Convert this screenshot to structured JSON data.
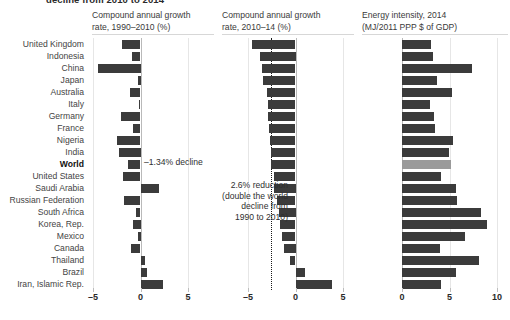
{
  "headline": "decline from 2010 to 2014",
  "colors": {
    "bar": "#3b3b3b",
    "highlight": "#9a9a9a",
    "text": "#3c3c3c",
    "refline": "#1a1a1a",
    "grid": "#e6e6e6"
  },
  "categories": [
    "United Kingdom",
    "Indonesia",
    "China",
    "Japan",
    "Australia",
    "Italy",
    "Germany",
    "France",
    "Nigeria",
    "India",
    "World",
    "United States",
    "Saudi Arabia",
    "Russian Federation",
    "South Africa",
    "Korea, Rep.",
    "Mexico",
    "Canada",
    "Thailand",
    "Brazil",
    "Iran, Islamic Rep."
  ],
  "bold_category": "World",
  "annotations": {
    "world_decline": "–1.34% decline",
    "reduction_line1": "2.6% reduction",
    "reduction_line2": "(double the world",
    "reduction_line3": "decline from",
    "reduction_line4": "1990 to 2010)"
  },
  "chart_data": [
    {
      "type": "bar",
      "orientation": "horizontal",
      "panel": 1,
      "title": "Compound annual growth rate, 1990–2010 (%)",
      "xlabel": "",
      "ylabel": "",
      "xlim": [
        -5,
        5
      ],
      "xticks": [
        -5,
        0,
        5
      ],
      "xticklabels": [
        "–5",
        "0",
        "5"
      ],
      "grid": true,
      "categories": [
        "United Kingdom",
        "Indonesia",
        "China",
        "Japan",
        "Australia",
        "Italy",
        "Germany",
        "France",
        "Nigeria",
        "India",
        "World",
        "United States",
        "Saudi Arabia",
        "Russian Federation",
        "South Africa",
        "Korea, Rep.",
        "Mexico",
        "Canada",
        "Thailand",
        "Brazil",
        "Iran, Islamic Rep."
      ],
      "values": [
        -1.95,
        -0.85,
        -4.5,
        -0.25,
        -1.1,
        -0.15,
        -2.05,
        -0.8,
        -2.45,
        -2.25,
        -1.34,
        -1.8,
        1.95,
        -1.7,
        -0.45,
        -0.75,
        -0.25,
        -1.05,
        0.45,
        0.7,
        2.4
      ]
    },
    {
      "type": "bar",
      "orientation": "horizontal",
      "panel": 2,
      "title": "Compound annual growth rate, 2010–14 (%)",
      "xlabel": "",
      "ylabel": "",
      "xlim": [
        -5,
        5
      ],
      "xticks": [
        -5,
        0,
        5
      ],
      "xticklabels": [
        "–5",
        "0",
        "5"
      ],
      "grid": true,
      "reference_line": -2.6,
      "reference_label": "2.6% reduction (double the world decline from 1990 to 2010)",
      "categories": [
        "United Kingdom",
        "Indonesia",
        "China",
        "Japan",
        "Australia",
        "Italy",
        "Germany",
        "France",
        "Nigeria",
        "India",
        "World",
        "United States",
        "Saudi Arabia",
        "Russian Federation",
        "South Africa",
        "Korea, Rep.",
        "Mexico",
        "Canada",
        "Thailand",
        "Brazil",
        "Iran, Islamic Rep."
      ],
      "values": [
        -4.55,
        -3.75,
        -3.55,
        -3.45,
        -2.95,
        -2.9,
        -2.85,
        -2.8,
        -2.7,
        -2.6,
        -2.6,
        -2.3,
        -2.25,
        -1.95,
        -1.75,
        -1.6,
        -1.45,
        -1.25,
        -0.55,
        0.95,
        3.85
      ]
    },
    {
      "type": "bar",
      "orientation": "horizontal",
      "panel": 3,
      "title": "Energy intensity, 2014 (MJ/2011 PPP $ of GDP)",
      "xlabel": "",
      "ylabel": "",
      "xlim": [
        0,
        10
      ],
      "xticks": [
        0,
        5,
        10
      ],
      "xticklabels": [
        "0",
        "5",
        "10"
      ],
      "grid": true,
      "highlight_category": "World",
      "categories": [
        "United Kingdom",
        "Indonesia",
        "China",
        "Japan",
        "Australia",
        "Italy",
        "Germany",
        "France",
        "Nigeria",
        "India",
        "World",
        "United States",
        "Saudi Arabia",
        "Russian Federation",
        "South Africa",
        "Korea, Rep.",
        "Mexico",
        "Canada",
        "Thailand",
        "Brazil",
        "Iran, Islamic Rep."
      ],
      "values": [
        3.1,
        3.3,
        7.35,
        3.7,
        5.25,
        2.95,
        3.35,
        3.5,
        5.4,
        4.9,
        5.15,
        4.1,
        5.65,
        5.8,
        8.35,
        8.9,
        6.65,
        4.0,
        8.15,
        5.7,
        4.1
      ],
      "values_tail": [
        8.6
      ]
    }
  ],
  "panels": [
    {
      "title_line1": "Compound annual growth",
      "title_line2": "rate, 1990–2010 (%)",
      "ticklabels": [
        "–5",
        "0",
        "5"
      ]
    },
    {
      "title_line1": "Compound annual growth",
      "title_line2": "rate, 2010–14 (%)",
      "ticklabels": [
        "–5",
        "0",
        "5"
      ]
    },
    {
      "title_line1": "Energy intensity, 2014",
      "title_line2": "(MJ/2011 PPP $ of GDP)",
      "ticklabels": [
        "0",
        "5",
        "10"
      ]
    }
  ]
}
